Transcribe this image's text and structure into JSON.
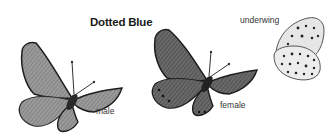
{
  "plate": {
    "title": "Dotted Blue",
    "figures": [
      {
        "id": "male",
        "label": "male",
        "view": "upperside"
      },
      {
        "id": "female",
        "label": "female",
        "view": "upperside"
      },
      {
        "id": "underwing",
        "label": "underwing",
        "view": "underside"
      }
    ]
  },
  "colors": {
    "background": "#ffffff",
    "wing_male": "#8a8a8a",
    "wing_female": "#5a5a5a",
    "underwing": "#e4e4e4",
    "border": "#1e1e1e"
  }
}
